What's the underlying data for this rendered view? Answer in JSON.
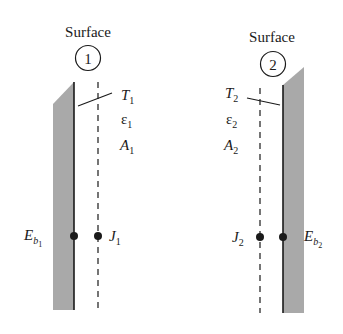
{
  "diagram": {
    "surface1": {
      "title": "Surface",
      "number": "1",
      "temperature_label": "T",
      "temperature_sub": "1",
      "emissivity_label": "ε",
      "emissivity_sub": "1",
      "area_label": "A",
      "area_sub": "1",
      "blackbody_label": "E",
      "blackbody_sub": "b",
      "blackbody_subsub": "1",
      "radiosity_label": "J",
      "radiosity_sub": "1"
    },
    "surface2": {
      "title": "Surface",
      "number": "2",
      "temperature_label": "T",
      "temperature_sub": "2",
      "emissivity_label": "ε",
      "emissivity_sub": "2",
      "area_label": "A",
      "area_sub": "2",
      "blackbody_label": "E",
      "blackbody_sub": "b",
      "blackbody_subsub": "2",
      "radiosity_label": "J",
      "radiosity_sub": "2"
    },
    "colors": {
      "ink": "#1a1a1a",
      "shading": "#a9a9a9"
    }
  }
}
